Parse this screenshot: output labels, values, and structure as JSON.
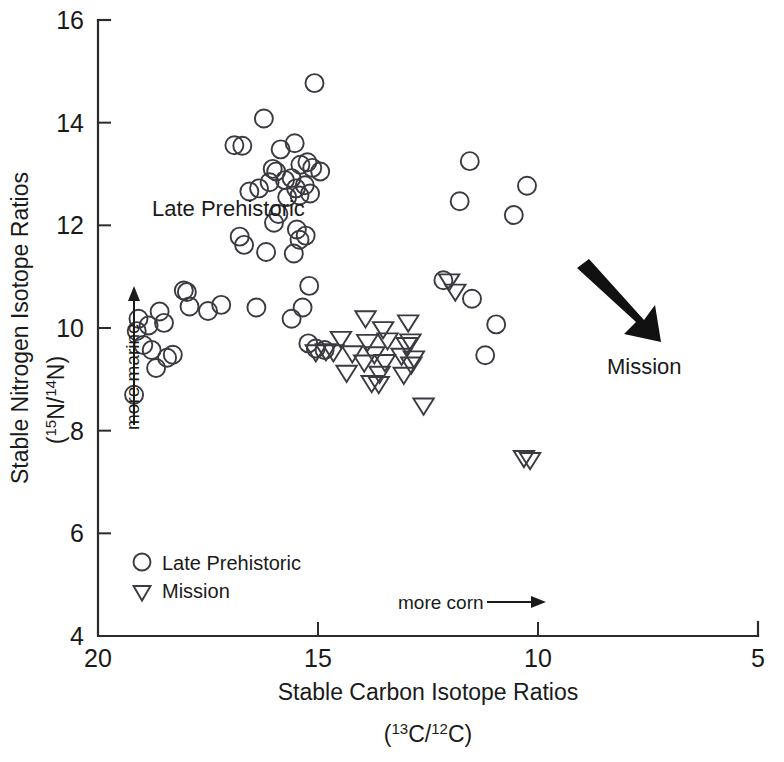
{
  "chart_data": {
    "type": "scatter",
    "title": "",
    "xlabel": "Stable Carbon Isotope Ratios",
    "xlabel_sub": "(13C/12C)",
    "ylabel": "Stable Nitrogen Isotope Ratios",
    "ylabel_sub": "(15N/14N)",
    "xlim": [
      20,
      5
    ],
    "ylim": [
      4,
      16
    ],
    "x_reversed": true,
    "xticks": [
      20,
      15,
      10,
      5
    ],
    "yticks": [
      4,
      6,
      8,
      10,
      12,
      14,
      16
    ],
    "grid": false,
    "legend_position": "bottom-left",
    "annotations": [
      {
        "name": "late-prehistoric-group-label",
        "text": "Late Prehistoric",
        "x": 16.9,
        "y": 12.25
      },
      {
        "name": "mission-group-label",
        "text": "Mission",
        "x": 7.55,
        "y": 9.3
      },
      {
        "name": "more-marine-axis-note",
        "text": "more marine"
      },
      {
        "name": "more-corn-axis-note",
        "text": "more corn"
      }
    ],
    "series": [
      {
        "name": "Late Prehistoric",
        "marker": "circle",
        "points": [
          [
            15.08,
            14.77
          ],
          [
            16.23,
            14.08
          ],
          [
            15.53,
            13.6
          ],
          [
            16.9,
            13.56
          ],
          [
            16.72,
            13.55
          ],
          [
            15.85,
            13.48
          ],
          [
            15.24,
            13.23
          ],
          [
            15.4,
            13.18
          ],
          [
            16.03,
            13.1
          ],
          [
            15.95,
            13.05
          ],
          [
            15.13,
            13.12
          ],
          [
            14.95,
            13.05
          ],
          [
            11.55,
            13.25
          ],
          [
            15.6,
            12.92
          ],
          [
            15.75,
            12.88
          ],
          [
            16.1,
            12.84
          ],
          [
            15.3,
            12.78
          ],
          [
            15.5,
            12.72
          ],
          [
            16.34,
            12.72
          ],
          [
            16.56,
            12.66
          ],
          [
            15.18,
            12.62
          ],
          [
            15.42,
            12.58
          ],
          [
            15.7,
            12.55
          ],
          [
            10.25,
            12.77
          ],
          [
            11.78,
            12.47
          ],
          [
            10.55,
            12.2
          ],
          [
            15.9,
            12.22
          ],
          [
            16.0,
            12.05
          ],
          [
            15.48,
            11.92
          ],
          [
            15.28,
            11.8
          ],
          [
            15.42,
            11.72
          ],
          [
            16.78,
            11.78
          ],
          [
            16.68,
            11.62
          ],
          [
            15.55,
            11.45
          ],
          [
            16.18,
            11.48
          ],
          [
            15.2,
            10.82
          ],
          [
            12.15,
            10.93
          ],
          [
            17.98,
            10.7
          ],
          [
            17.2,
            10.45
          ],
          [
            16.4,
            10.4
          ],
          [
            15.35,
            10.4
          ],
          [
            11.5,
            10.57
          ],
          [
            18.05,
            10.73
          ],
          [
            17.92,
            10.42
          ],
          [
            15.6,
            10.18
          ],
          [
            10.95,
            10.07
          ],
          [
            18.6,
            10.32
          ],
          [
            17.5,
            10.33
          ],
          [
            19.08,
            10.18
          ],
          [
            18.5,
            10.1
          ],
          [
            18.85,
            10.05
          ],
          [
            19.12,
            9.94
          ],
          [
            18.97,
            9.67
          ],
          [
            18.78,
            9.57
          ],
          [
            15.22,
            9.7
          ],
          [
            15.05,
            9.6
          ],
          [
            14.85,
            9.57
          ],
          [
            18.3,
            9.48
          ],
          [
            18.43,
            9.42
          ],
          [
            11.2,
            9.47
          ],
          [
            18.68,
            9.22
          ],
          [
            19.18,
            8.7
          ]
        ]
      },
      {
        "name": "Mission",
        "marker": "triangle-down",
        "points": [
          [
            15.05,
            9.52
          ],
          [
            13.92,
            10.18
          ],
          [
            13.52,
            9.97
          ],
          [
            12.95,
            10.1
          ],
          [
            14.48,
            9.78
          ],
          [
            13.88,
            9.72
          ],
          [
            13.42,
            9.75
          ],
          [
            12.9,
            9.73
          ],
          [
            12.98,
            9.66
          ],
          [
            14.82,
            9.54
          ],
          [
            14.65,
            9.52
          ],
          [
            14.22,
            9.5
          ],
          [
            13.72,
            9.48
          ],
          [
            13.1,
            9.45
          ],
          [
            12.82,
            9.4
          ],
          [
            13.95,
            9.32
          ],
          [
            13.48,
            9.33
          ],
          [
            12.88,
            9.28
          ],
          [
            14.35,
            9.12
          ],
          [
            13.6,
            9.1
          ],
          [
            13.05,
            9.08
          ],
          [
            12.02,
            10.9
          ],
          [
            11.88,
            10.7
          ],
          [
            13.78,
            8.92
          ],
          [
            13.62,
            8.9
          ],
          [
            12.6,
            8.48
          ],
          [
            10.32,
            7.46
          ],
          [
            10.18,
            7.42
          ]
        ]
      }
    ]
  },
  "legend": {
    "items": [
      {
        "marker": "circle",
        "label": "Late Prehistoric"
      },
      {
        "marker": "triangle-down",
        "label": "Mission"
      }
    ]
  },
  "axis_notes": {
    "y_direction": "more marine",
    "x_direction": "more corn"
  },
  "labels": {
    "late_prehistoric_group": "Late Prehistoric",
    "mission_group": "Mission"
  },
  "ylabel_parts": {
    "line1": "Stable Nitrogen Isotope Ratios",
    "open_paren": "(",
    "sup1": "15",
    "elem1": "N/",
    "sup2": "14",
    "elem2": "N",
    "close_paren": ")"
  },
  "xlabel_parts": {
    "line1": "Stable Carbon Isotope Ratios",
    "open_paren": "(",
    "sup1": "13",
    "elem1": "C/",
    "sup2": "12",
    "elem2": "C",
    "close_paren": ")"
  }
}
